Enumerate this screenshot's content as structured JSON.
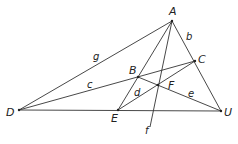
{
  "points": {
    "A": {
      "x": 172,
      "y": 21,
      "label": "A",
      "lx": 169,
      "ly": 15
    },
    "B": {
      "x": 138,
      "y": 77,
      "label": "B",
      "lx": 129,
      "ly": 74
    },
    "C": {
      "x": 195,
      "y": 61,
      "label": "C",
      "lx": 198,
      "ly": 63
    },
    "D": {
      "x": 19,
      "y": 110,
      "label": "D",
      "lx": 6,
      "ly": 116
    },
    "E": {
      "x": 118,
      "y": 110,
      "label": "E",
      "lx": 111,
      "ly": 122
    },
    "F": {
      "x": 158,
      "y": 85,
      "label": "F",
      "lx": 168,
      "ly": 89
    },
    "U": {
      "x": 221,
      "y": 111,
      "label": "U",
      "lx": 224,
      "ly": 116
    }
  },
  "line_labels": {
    "g": {
      "text": "g",
      "x": 93,
      "y": 60
    },
    "b": {
      "text": "b",
      "x": 186,
      "y": 40
    },
    "c": {
      "text": "c",
      "x": 87,
      "y": 88
    },
    "d": {
      "text": "d",
      "x": 134,
      "y": 96
    },
    "e": {
      "text": "e",
      "x": 188,
      "y": 97
    },
    "f": {
      "text": "f",
      "x": 145,
      "y": 134
    }
  }
}
